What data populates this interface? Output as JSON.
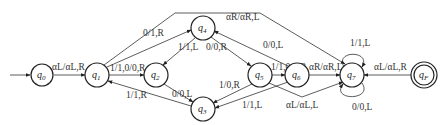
{
  "diagram": {
    "type": "turing-machine-state-diagram",
    "states": [
      {
        "id": "q0",
        "name": "q",
        "sub": "0",
        "x": 42,
        "y": 75,
        "start": true
      },
      {
        "id": "q1",
        "name": "q",
        "sub": "1",
        "x": 97,
        "y": 75
      },
      {
        "id": "q2",
        "name": "q",
        "sub": "2",
        "x": 156,
        "y": 75
      },
      {
        "id": "q3",
        "name": "q",
        "sub": "3",
        "x": 203,
        "y": 109
      },
      {
        "id": "q4",
        "name": "q",
        "sub": "4",
        "x": 203,
        "y": 28
      },
      {
        "id": "q5",
        "name": "q",
        "sub": "5",
        "x": 260,
        "y": 75
      },
      {
        "id": "q6",
        "name": "q",
        "sub": "6",
        "x": 297,
        "y": 75
      },
      {
        "id": "q7",
        "name": "q",
        "sub": "7",
        "x": 352,
        "y": 75
      },
      {
        "id": "qF",
        "name": "q",
        "sub": "F",
        "x": 424,
        "y": 75,
        "accept": true
      }
    ],
    "transitions": [
      {
        "from": "q0",
        "to": "q1",
        "label": "αL/αL,R"
      },
      {
        "from": "q1",
        "to": "q2",
        "label": "1/1,0/0,R"
      },
      {
        "from": "q1",
        "to": "q4",
        "label": "0/1,R"
      },
      {
        "from": "q1",
        "to": "q7",
        "label": "αR/αR,L"
      },
      {
        "from": "q4",
        "to": "q2",
        "label": "1/1,L"
      },
      {
        "from": "q4",
        "to": "q5",
        "label": "0/0,R"
      },
      {
        "from": "q2",
        "to": "q3",
        "label": "0/0,L"
      },
      {
        "from": "q3",
        "to": "q1",
        "label": "1/1,R"
      },
      {
        "from": "q5",
        "to": "q3",
        "label": "1/0,R"
      },
      {
        "from": "q5",
        "to": "q6",
        "label": "1/1,0/0,R"
      },
      {
        "from": "q6",
        "to": "q4",
        "label": "0/0,L"
      },
      {
        "from": "q6",
        "to": "q3",
        "label": "1/1,L"
      },
      {
        "from": "q6",
        "to": "q7",
        "label": "αR/αR,L"
      },
      {
        "from": "q5",
        "to": "q7",
        "label": "αL/αL,L"
      },
      {
        "from": "q7",
        "to": "q7",
        "label": "1/1,L",
        "loop": "top"
      },
      {
        "from": "q7",
        "to": "q7",
        "label": "0/0,L",
        "loop": "bottom"
      },
      {
        "from": "qF",
        "to": "q7",
        "label": "αL/αL,R"
      }
    ]
  },
  "labels": {
    "q0_q1": "α",
    "e_q0q1": "αL/αL,R",
    "e_q1q2": "1/1,0/0,R",
    "e_q1q4": "0/1,R",
    "e_top": "αR/αR,L",
    "e_q4q2": "1/1,L",
    "e_q4q5": "0/0,R",
    "e_q6q4": "0/0,L",
    "e_q2q3": "0/0,L",
    "e_q3q1": "1/1,R",
    "e_q5q3": "1/0,R",
    "e_q6q3": "1/1,L",
    "e_q5q6": "1/1,0/0,R",
    "e_q6q7": "αR/αR,L",
    "e_q5q7": "αL/αL,L",
    "e_loop_top": "1/1,L",
    "e_loop_bot": "0/0,L",
    "e_qFq7": "αL/αL,R",
    "s_q": "q",
    "s0": "0",
    "s1": "1",
    "s2": "2",
    "s3": "3",
    "s4": "4",
    "s5": "5",
    "s6": "6",
    "s7": "7",
    "sF": "F"
  }
}
